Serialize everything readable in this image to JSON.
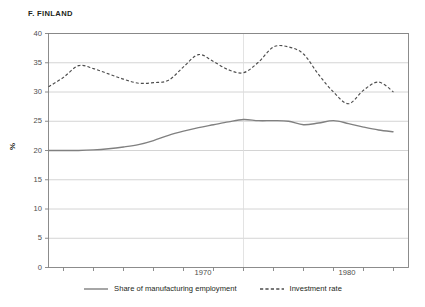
{
  "chart_data": {
    "type": "line",
    "title": "F. FINLAND",
    "xlabel": "",
    "ylabel": "%",
    "xlim": [
      1961,
      1985
    ],
    "ylim": [
      0,
      40
    ],
    "yticks": [
      0,
      5,
      10,
      15,
      20,
      25,
      30,
      35,
      40
    ],
    "xticks": [
      1962,
      1964,
      1966,
      1968,
      1970,
      1972,
      1974,
      1976,
      1978,
      1980,
      1982,
      1984
    ],
    "xtick_labels_shown": [
      {
        "value": 1970,
        "label": "1970"
      },
      {
        "value": 1980,
        "label": "1980"
      }
    ],
    "grid": "horizontal",
    "legend_position": "bottom-center",
    "annotations": [
      {
        "type": "vline",
        "value": 1974,
        "style": "faint-dotted"
      }
    ],
    "x": [
      1961,
      1962,
      1963,
      1964,
      1965,
      1966,
      1967,
      1968,
      1969,
      1970,
      1971,
      1972,
      1973,
      1974,
      1975,
      1976,
      1977,
      1978,
      1979,
      1980,
      1981,
      1982,
      1983,
      1984
    ],
    "series": [
      {
        "name": "Share of manufacturing employment",
        "style": "solid",
        "color": "#808080",
        "values": [
          20.0,
          20.0,
          20.0,
          20.1,
          20.3,
          20.6,
          21.0,
          21.7,
          22.6,
          23.3,
          23.9,
          24.4,
          24.9,
          25.3,
          25.1,
          25.1,
          25.0,
          24.4,
          24.7,
          25.1,
          24.6,
          24.0,
          23.5,
          23.2
        ]
      },
      {
        "name": "Investment rate",
        "style": "dashed",
        "color": "#4d4d4d",
        "values": [
          30.9,
          32.5,
          34.5,
          34.0,
          33.1,
          32.2,
          31.5,
          31.6,
          32.0,
          34.3,
          36.4,
          35.2,
          33.8,
          33.3,
          35.1,
          37.7,
          37.7,
          36.5,
          33.0,
          30.0,
          28.0,
          30.3,
          31.7,
          30.0
        ]
      }
    ]
  },
  "axes": {
    "ytick_labels": [
      "40",
      "35",
      "30",
      "25",
      "20",
      "15",
      "10",
      "5",
      "0"
    ],
    "ylabel_text": "%",
    "xtick_1970": "1970",
    "xtick_1980": "1980"
  },
  "legend": {
    "items": [
      {
        "label": "Share of manufacturing employment",
        "style": "solid"
      },
      {
        "label": "Investment rate",
        "style": "dashed"
      }
    ]
  },
  "colors": {
    "axis": "#808080",
    "grid": "#c9c9c9",
    "text": "#231f20",
    "series_solid": "#808080",
    "series_dashed": "#4d4d4d",
    "background": "#ffffff"
  }
}
